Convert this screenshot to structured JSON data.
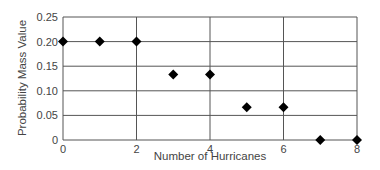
{
  "chart_data": {
    "type": "scatter",
    "title": "",
    "xlabel": "Number of Hurricanes",
    "ylabel": "Probability Mass Value",
    "x": [
      0,
      1,
      2,
      3,
      4,
      5,
      6,
      7,
      8
    ],
    "values": [
      0.2,
      0.2,
      0.2,
      0.1333,
      0.1333,
      0.0667,
      0.0667,
      0,
      0
    ],
    "xlim": [
      0,
      8
    ],
    "ylim": [
      0,
      0.25
    ],
    "x_ticks": [
      "0",
      "2",
      "4",
      "6",
      "8"
    ],
    "y_ticks": [
      "0",
      "0.05",
      "0.10",
      "0.15",
      "0.20",
      "0.25"
    ],
    "grid": true,
    "marker": "diamond",
    "marker_color": "#000000",
    "legend": null
  }
}
